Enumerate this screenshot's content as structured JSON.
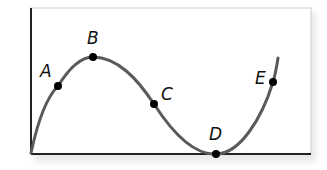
{
  "diagram": {
    "type": "function-curve",
    "curve_color": "#5a5a5a",
    "point_color": "#000000",
    "frame_color": "#222222",
    "points": [
      {
        "label": "A",
        "x": 58,
        "y": 86
      },
      {
        "label": "B",
        "x": 93,
        "y": 57
      },
      {
        "label": "C",
        "x": 154,
        "y": 104
      },
      {
        "label": "D",
        "x": 216,
        "y": 154
      },
      {
        "label": "E",
        "x": 273,
        "y": 82
      }
    ]
  }
}
